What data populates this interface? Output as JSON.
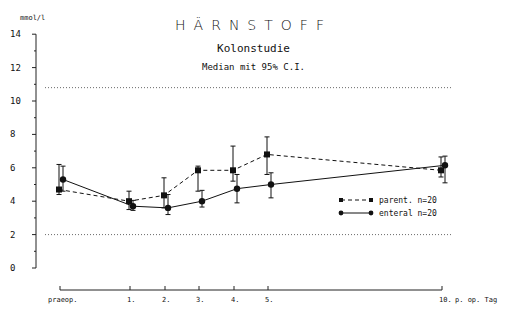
{
  "chart_data": {
    "type": "line",
    "title": "HÄRNSTOFF",
    "subtitle": "Kolonstudie",
    "subtitle2": "Median mit 95% C.I.",
    "ylabel": "mmol/l",
    "xlabel": "p. op. Tag",
    "ylim": [
      0,
      14
    ],
    "y_ticks": [
      0,
      2,
      4,
      6,
      8,
      10,
      12,
      14
    ],
    "categories": [
      "praeop.",
      "1.",
      "2.",
      "3.",
      "4.",
      "5.",
      "10."
    ],
    "x_positions": [
      0,
      1,
      2,
      3,
      4,
      5,
      10
    ],
    "reference_lines": [
      10.8,
      2.0
    ],
    "grid": false,
    "legend_position": "lower right",
    "series": [
      {
        "name": "parent. n=20",
        "style": "dashed",
        "marker": "square",
        "values": [
          4.7,
          4.0,
          4.35,
          5.85,
          5.85,
          6.8,
          5.85
        ],
        "ci_upper": [
          6.2,
          4.6,
          5.4,
          6.1,
          7.3,
          7.85,
          6.65
        ],
        "ci_lower": [
          4.4,
          3.5,
          3.6,
          4.6,
          5.2,
          5.6,
          5.45
        ]
      },
      {
        "name": "enteral n=20",
        "style": "solid",
        "marker": "circle",
        "values": [
          5.3,
          3.7,
          3.6,
          4.0,
          4.75,
          5.0,
          6.15
        ],
        "ci_upper": [
          6.1,
          4.05,
          4.4,
          4.65,
          5.6,
          5.7,
          6.7
        ],
        "ci_lower": [
          4.6,
          3.45,
          3.2,
          3.65,
          3.9,
          4.2,
          5.1
        ]
      }
    ]
  }
}
